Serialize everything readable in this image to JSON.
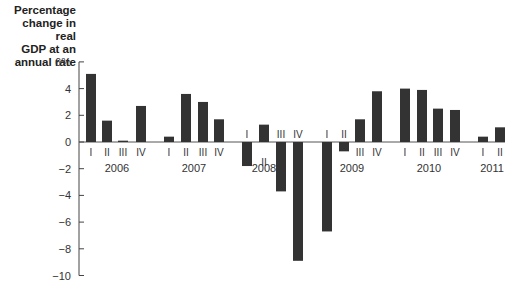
{
  "chart_data": {
    "type": "bar",
    "title": "",
    "ylabel": "Percentage change in real GDP at an annual rate",
    "xlabel": "",
    "ylim": [
      -10,
      6
    ],
    "yticks": [
      "6%",
      "4",
      "2",
      "0",
      "−2",
      "−4",
      "−6",
      "−8",
      "−10"
    ],
    "ytick_values": [
      6,
      4,
      2,
      0,
      -2,
      -4,
      -6,
      -8,
      -10
    ],
    "grid": false,
    "bar_color": "#333333",
    "years": [
      "2006",
      "2007",
      "2008",
      "2009",
      "2010",
      "2011"
    ],
    "categories": [
      "2006 I",
      "2006 II",
      "2006 III",
      "2006 IV",
      "2007 I",
      "2007 II",
      "2007 III",
      "2007 IV",
      "2008 I",
      "2008 II",
      "2008 III",
      "2008 IV",
      "2009 I",
      "2009 II",
      "2009 III",
      "2009 IV",
      "2010 I",
      "2010 II",
      "2010 III",
      "2010 IV",
      "2011 I",
      "2011 II"
    ],
    "quarter_labels": [
      "I",
      "II",
      "III",
      "IV",
      "I",
      "II",
      "III",
      "IV",
      "I",
      "II",
      "III",
      "IV",
      "I",
      "II",
      "III",
      "IV",
      "I",
      "II",
      "III",
      "IV",
      "I",
      "II"
    ],
    "values": [
      5.1,
      1.6,
      0.1,
      2.7,
      0.4,
      3.6,
      3.0,
      1.7,
      -1.8,
      1.3,
      -3.7,
      -8.9,
      -6.7,
      -0.7,
      1.7,
      3.8,
      4.0,
      3.9,
      2.5,
      2.4,
      0.4,
      1.1
    ]
  },
  "axis_title": {
    "line1": "Percentage",
    "line2": "change in real",
    "line3": "GDP at an",
    "line4": "annual rate"
  }
}
